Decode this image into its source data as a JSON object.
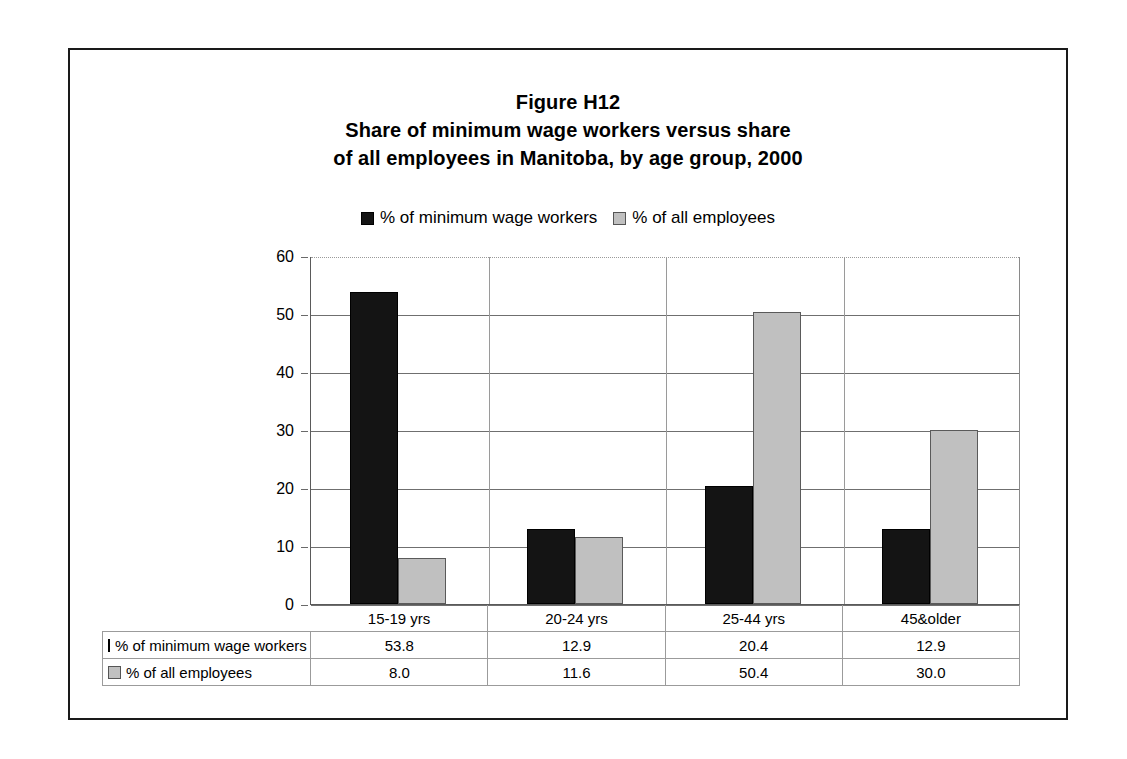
{
  "figure": {
    "title_lines": [
      "Figure H12",
      "Share of minimum wage workers versus share",
      "of all employees in Manitoba, by age group, 2000"
    ]
  },
  "legend": {
    "items": [
      {
        "label": "% of minimum wage workers",
        "color": "#141414",
        "marker": "filled-square-icon"
      },
      {
        "label": "% of all employees",
        "color": "#c0c0c0",
        "marker": "gray-square-icon"
      }
    ]
  },
  "axis": {
    "y_ticks": [
      "60",
      "50",
      "40",
      "30",
      "20",
      "10",
      "0"
    ]
  },
  "table": {
    "row_labels": [
      "% of minimum wage workers",
      "% of all employees"
    ],
    "categories": [
      "15-19 yrs",
      "20-24 yrs",
      "25-44 yrs",
      "45&older"
    ],
    "rows": [
      [
        "53.8",
        "12.9",
        "20.4",
        "12.9"
      ],
      [
        "8.0",
        "11.6",
        "50.4",
        "30.0"
      ]
    ]
  },
  "chart_data": {
    "type": "bar",
    "xlabel": "",
    "ylabel": "",
    "ylim": [
      0,
      60
    ],
    "ytick_step": 10,
    "grid": true,
    "legend_position": "top-center",
    "categories": [
      "15-19 yrs",
      "20-24 yrs",
      "25-44 yrs",
      "45&older"
    ],
    "series": [
      {
        "name": "% of minimum wage workers",
        "color": "#141414",
        "values": [
          53.8,
          12.9,
          20.4,
          12.9
        ]
      },
      {
        "name": "% of all employees",
        "color": "#c0c0c0",
        "values": [
          8.0,
          11.6,
          50.4,
          30.0
        ]
      }
    ]
  }
}
